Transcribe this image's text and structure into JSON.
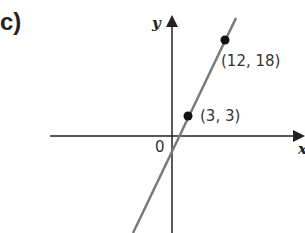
{
  "part_label": "c)",
  "axes": {
    "x_label": "x",
    "y_label": "y",
    "origin_label": "0"
  },
  "points": [
    {
      "label": "(3, 3)",
      "x": 3,
      "y": 3
    },
    {
      "label": "(12, 18)",
      "x": 12,
      "y": 18
    }
  ],
  "colors": {
    "line": "#7a7a7a",
    "axes": "#222222",
    "points": "#111111"
  }
}
